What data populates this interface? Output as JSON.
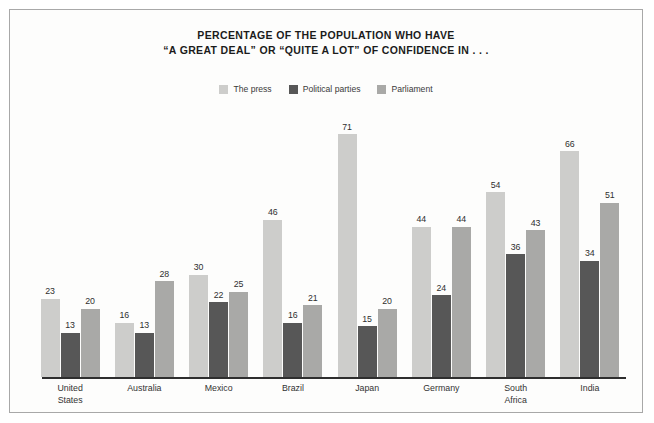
{
  "chart_data": {
    "type": "bar",
    "title": "PERCENTAGE OF THE POPULATION WHO HAVE “A GREAT DEAL” OR “QUITE A LOT” OF CONFIDENCE IN . . .",
    "title_lines": [
      "PERCENTAGE OF THE POPULATION WHO HAVE",
      "“A GREAT DEAL” OR “QUITE A LOT” OF CONFIDENCE IN . . ."
    ],
    "xlabel": "",
    "ylabel": "",
    "ylim": [
      0,
      75
    ],
    "grid": false,
    "legend_position": "top-center",
    "categories": [
      "United States",
      "Australia",
      "Mexico",
      "Brazil",
      "Japan",
      "Germany",
      "South Africa",
      "India"
    ],
    "category_lines": [
      [
        "United",
        "States"
      ],
      [
        "Australia"
      ],
      [
        "Mexico"
      ],
      [
        "Brazil"
      ],
      [
        "Japan"
      ],
      [
        "Germany"
      ],
      [
        "South",
        "Africa"
      ],
      [
        "India"
      ]
    ],
    "series": [
      {
        "name": "The press",
        "color": "#cdcdcb",
        "values": [
          23,
          16,
          30,
          46,
          71,
          44,
          54,
          66
        ]
      },
      {
        "name": "Political parties",
        "color": "#575757",
        "values": [
          13,
          13,
          22,
          16,
          15,
          24,
          36,
          34
        ]
      },
      {
        "name": "Parliament",
        "color": "#a9a9a7",
        "values": [
          20,
          28,
          25,
          21,
          20,
          44,
          43,
          51
        ]
      }
    ]
  },
  "colors": {
    "background": "#fdfdfc",
    "frame_border": "#a8a8a8",
    "axis": "#2e2e2e",
    "title_text": "#1b1b1b",
    "label_text": "#333333"
  }
}
